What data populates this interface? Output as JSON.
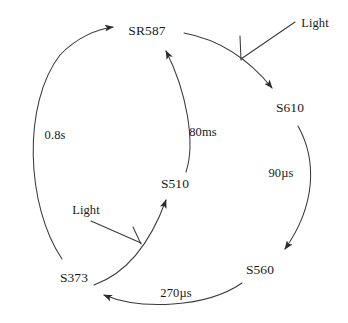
{
  "diagram": {
    "type": "cycle",
    "background_color": "#ffffff",
    "stroke_color": "#3a3a3a",
    "text_color": "#1a1a1a",
    "nodes": [
      {
        "id": "sr587",
        "label": "SR587"
      },
      {
        "id": "s610",
        "label": "S610"
      },
      {
        "id": "s560",
        "label": "S560"
      },
      {
        "id": "s373",
        "label": "S373"
      },
      {
        "id": "s510",
        "label": "S510"
      }
    ],
    "edges": [
      {
        "id": "sr587-s610",
        "from": "SR587",
        "to": "S610",
        "label": ""
      },
      {
        "id": "s610-s560",
        "from": "S610",
        "to": "S560",
        "label": "90µs"
      },
      {
        "id": "s560-s373",
        "from": "S560",
        "to": "S373",
        "label": "270µs"
      },
      {
        "id": "s373-sr587",
        "from": "S373",
        "to": "SR587",
        "label": "0.8s"
      },
      {
        "id": "s373-s510",
        "from": "S373",
        "to": "S510",
        "label": ""
      },
      {
        "id": "s510-sr587",
        "from": "S510",
        "to": "SR587",
        "label": "80ms"
      }
    ],
    "light_inputs": [
      {
        "id": "light-top",
        "label": "Light",
        "target_edge": "sr587-s610"
      },
      {
        "id": "light-bottom",
        "label": "Light",
        "target_edge": "s373-s510"
      }
    ]
  }
}
